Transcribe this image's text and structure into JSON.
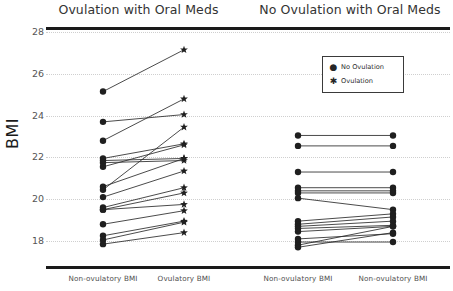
{
  "chart_data": {
    "type": "line",
    "title": "",
    "xlabel": "",
    "ylabel": "BMI",
    "ylim": [
      17.5,
      28.2
    ],
    "yticks": [
      18,
      20,
      22,
      24,
      26,
      28
    ],
    "grid": true,
    "legend_position": "upper right of second panel",
    "legend": [
      {
        "label": "No Ovulation",
        "marker": "circle"
      },
      {
        "label": "Ovulation",
        "marker": "star"
      }
    ],
    "panels": [
      {
        "title": "Ovulation with Oral Meds",
        "categories": [
          "Non-ovulatory BMI",
          "Ovulatory BMI"
        ],
        "pairs": [
          {
            "start": 25.15,
            "end": 27.15
          },
          {
            "start": 23.7,
            "end": 24.05
          },
          {
            "start": 22.8,
            "end": 24.8
          },
          {
            "start": 21.95,
            "end": 22.65
          },
          {
            "start": 21.85,
            "end": 21.95
          },
          {
            "start": 21.75,
            "end": 21.85
          },
          {
            "start": 21.55,
            "end": 22.6
          },
          {
            "start": 20.6,
            "end": 21.95
          },
          {
            "start": 20.45,
            "end": 23.45
          },
          {
            "start": 20.1,
            "end": 21.35
          },
          {
            "start": 19.6,
            "end": 20.55
          },
          {
            "start": 19.5,
            "end": 20.3
          },
          {
            "start": 19.5,
            "end": 19.75
          },
          {
            "start": 18.8,
            "end": 19.45
          },
          {
            "start": 18.25,
            "end": 18.95
          },
          {
            "start": 18.05,
            "end": 18.9
          },
          {
            "start": 17.85,
            "end": 18.4
          }
        ]
      },
      {
        "title": "No Ovulation with Oral Meds",
        "categories": [
          "Non-ovulatory BMI",
          "Non-ovulatory BMI"
        ],
        "pairs": [
          {
            "start": 23.05,
            "end": 23.05
          },
          {
            "start": 22.55,
            "end": 22.55
          },
          {
            "start": 21.3,
            "end": 21.3
          },
          {
            "start": 20.55,
            "end": 20.55
          },
          {
            "start": 20.4,
            "end": 20.4
          },
          {
            "start": 20.3,
            "end": 20.3
          },
          {
            "start": 20.05,
            "end": 19.5
          },
          {
            "start": 18.95,
            "end": 19.3
          },
          {
            "start": 18.8,
            "end": 19.15
          },
          {
            "start": 18.7,
            "end": 18.95
          },
          {
            "start": 18.6,
            "end": 18.75
          },
          {
            "start": 18.45,
            "end": 18.7
          },
          {
            "start": 18.1,
            "end": 18.35
          },
          {
            "start": 17.95,
            "end": 17.95
          },
          {
            "start": 17.8,
            "end": 18.7
          },
          {
            "start": 17.7,
            "end": 18.4
          }
        ]
      }
    ]
  }
}
